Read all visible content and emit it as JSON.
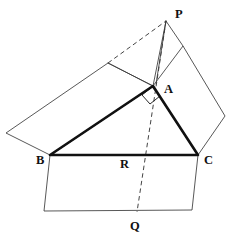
{
  "figure": {
    "kind": "euclid-pythagorean-theorem-diagram",
    "background_color": "#ffffff",
    "line_color": "#3a3a3a",
    "emphasis_color": "#111111",
    "labels": {
      "A": "A",
      "B": "B",
      "C": "C",
      "P": "P",
      "Q": "Q",
      "R": "R"
    },
    "label_positions": {
      "A": {
        "x": 164,
        "y": 93
      },
      "B": {
        "x": 36,
        "y": 164
      },
      "C": {
        "x": 204,
        "y": 164
      },
      "P": {
        "x": 175,
        "y": 18
      },
      "Q": {
        "x": 130,
        "y": 230
      },
      "R": {
        "x": 120,
        "y": 168
      }
    },
    "points": {
      "A": {
        "x": 153,
        "y": 86
      },
      "B": {
        "x": 50,
        "y": 155
      },
      "C": {
        "x": 198,
        "y": 155
      },
      "P": {
        "x": 166,
        "y": 21
      },
      "Q": {
        "x": 137,
        "y": 212
      },
      "R": {
        "x": 143,
        "y": 155
      },
      "AB_square_far_b": {
        "x": 6,
        "y": 133
      },
      "AB_square_far_a": {
        "x": 108,
        "y": 63
      },
      "AC_square_far_a": {
        "x": 183,
        "y": 46
      },
      "AC_square_far_c": {
        "x": 225,
        "y": 116
      },
      "BC_square_far_b": {
        "x": 44,
        "y": 211
      },
      "BC_square_far_c": {
        "x": 192,
        "y": 210
      }
    },
    "triangle": {
      "name": "right-triangle-ABC",
      "path": "M 50 155 L 153 86 L 198 155 Z",
      "right_angle_at": "A"
    },
    "squares": [
      {
        "name": "square-on-AB",
        "path": "M 50 155 L 6 133 L 108 63 L 153 86 Z"
      },
      {
        "name": "square-on-AC",
        "path": "M 153 86 L 183 46 L 225 116 L 198 155 Z"
      },
      {
        "name": "square-on-BC",
        "path": "M 50 155 L 44 211 L 192 210 L 198 155 Z"
      }
    ],
    "construction_lines": [
      {
        "name": "line-P-to-A",
        "path": "M 166 21 L 153 86"
      },
      {
        "name": "line-P-to-AC-far-corner",
        "path": "M 166 21 L 183 46"
      },
      {
        "name": "line-AB-far-corner-to-P-region",
        "path": "M 108 63 L 153 86"
      },
      {
        "name": "line-P-to-A-extension-upper",
        "path": "M 166 21 L 156 84"
      }
    ],
    "dashed_lines": [
      {
        "name": "dashed-AB-far-corner-to-P",
        "path": "M 108 63 L 166 21"
      },
      {
        "name": "dashed-altitude-P-through-A-to-Q",
        "path": "M 166 21 L 137 212"
      }
    ],
    "right_angle_marker": {
      "name": "right-angle-marker-at-A",
      "path": "M 142 95 L 150 104 L 160 96 L 152 87 Z"
    }
  }
}
